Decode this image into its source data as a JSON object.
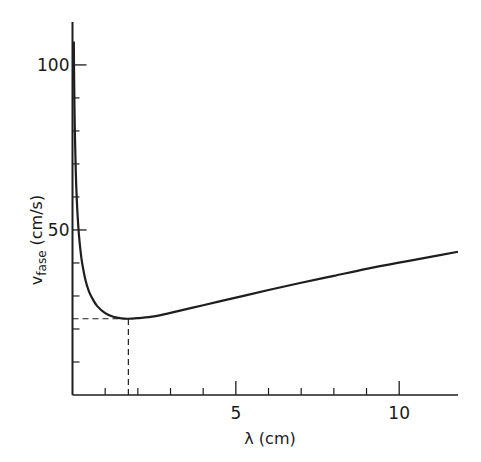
{
  "chart_data": {
    "type": "line",
    "title": "",
    "xlabel": "λ (cm)",
    "ylabel": "v_fase (cm/s)",
    "ylabel_main": "v",
    "ylabel_sub": "fase",
    "ylabel_unit": "(cm/s)",
    "xlim": [
      0,
      11.8
    ],
    "ylim": [
      0,
      113
    ],
    "x_ticks_major": [
      5,
      10
    ],
    "x_tick_labels": [
      "5",
      "10"
    ],
    "x_ticks_minor": [
      1,
      2,
      3,
      4,
      6,
      7,
      8,
      9
    ],
    "y_ticks_major": [
      50,
      100
    ],
    "y_tick_labels": [
      "50",
      "100"
    ],
    "y_ticks_minor": [
      10,
      20,
      30,
      40,
      60,
      70,
      80,
      90
    ],
    "grid": false,
    "legend": null,
    "series": [
      {
        "name": "phase velocity",
        "x": [
          0.04,
          0.05,
          0.07,
          0.1,
          0.13,
          0.16,
          0.2,
          0.25,
          0.3,
          0.4,
          0.5,
          0.6,
          0.75,
          1.0,
          1.25,
          1.5,
          1.71,
          2.0,
          2.5,
          3.0,
          4.0,
          5.0,
          6.0,
          7.0,
          8.0,
          9.0,
          10.0,
          11.0,
          11.8
        ],
        "y": [
          107.1,
          95.8,
          81.0,
          67.8,
          59.5,
          53.8,
          48.2,
          43.3,
          39.7,
          34.7,
          31.5,
          29.4,
          27.0,
          24.8,
          23.7,
          23.2,
          23.1,
          23.3,
          23.8,
          24.9,
          27.2,
          29.5,
          31.8,
          34.0,
          36.1,
          38.2,
          40.1,
          41.9,
          43.4
        ]
      }
    ],
    "annotations": [
      {
        "type": "dashed-horizontal",
        "y": 23.1,
        "x_from": 0,
        "x_to": 1.71,
        "label": "minimum phase velocity"
      },
      {
        "type": "dashed-vertical",
        "x": 1.71,
        "y_from": 0,
        "y_to": 23.1,
        "label": "wavelength at minimum"
      }
    ]
  }
}
